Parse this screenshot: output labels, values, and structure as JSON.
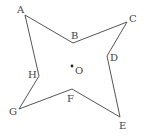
{
  "diagram": {
    "type": "star-shaped octagon",
    "stroke_color": "#555555",
    "label_color": "#444444",
    "vertices": [
      {
        "id": "A",
        "label": "A",
        "x": 25,
        "y": 15,
        "lx": 17,
        "ly": 13
      },
      {
        "id": "B",
        "label": "B",
        "x": 73,
        "y": 43,
        "lx": 71,
        "ly": 39
      },
      {
        "id": "C",
        "label": "C",
        "x": 127,
        "y": 22,
        "lx": 129,
        "ly": 22
      },
      {
        "id": "D",
        "label": "D",
        "x": 107,
        "y": 56,
        "lx": 110,
        "ly": 61
      },
      {
        "id": "E",
        "label": "E",
        "x": 120,
        "y": 117,
        "lx": 119,
        "ly": 129
      },
      {
        "id": "F",
        "label": "F",
        "x": 72,
        "y": 89,
        "lx": 67,
        "ly": 102
      },
      {
        "id": "G",
        "label": "G",
        "x": 19,
        "y": 109,
        "lx": 9,
        "ly": 115
      },
      {
        "id": "H",
        "label": "H",
        "x": 39,
        "y": 76,
        "lx": 28,
        "ly": 78
      }
    ],
    "center": {
      "label": "O",
      "x": 72,
      "y": 66,
      "lx": 75,
      "ly": 74
    }
  }
}
